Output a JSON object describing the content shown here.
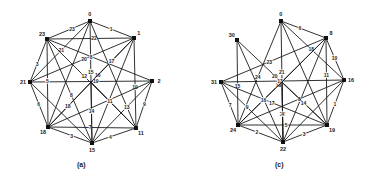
{
  "figure": {
    "background": "#ffffff",
    "ink_color": "#1a1a1a",
    "graphs": [
      {
        "id": "a",
        "caption": "(a)",
        "caption_pos": [
          83,
          167
        ],
        "nodes": [
          {
            "label": "0",
            "x": 90,
            "y": 21
          },
          {
            "label": "1",
            "x": 134,
            "y": 38
          },
          {
            "label": "2",
            "x": 152,
            "y": 81
          },
          {
            "label": "11",
            "x": 136,
            "y": 128
          },
          {
            "label": "15",
            "x": 92,
            "y": 143
          },
          {
            "label": "18",
            "x": 48,
            "y": 127
          },
          {
            "label": "21",
            "x": 30,
            "y": 82
          },
          {
            "label": "23",
            "x": 47,
            "y": 39
          },
          {
            "label": "c",
            "x": 91,
            "y": 82,
            "hidden": true
          }
        ],
        "edges": [
          {
            "from": "0",
            "to": "23",
            "label": "23"
          },
          {
            "from": "0",
            "to": "1",
            "label": "1"
          },
          {
            "from": "23",
            "to": "1",
            "label": "22"
          },
          {
            "from": "0",
            "to": "15",
            "label": "15"
          },
          {
            "from": "0",
            "to": "21",
            "label": "21"
          },
          {
            "from": "0",
            "to": "11",
            "label": ""
          },
          {
            "from": "0",
            "to": "18",
            "label": ""
          },
          {
            "from": "1",
            "to": "21",
            "label": "20"
          },
          {
            "from": "1",
            "to": "11",
            "label": "10"
          },
          {
            "from": "1",
            "to": "18",
            "label": "16"
          },
          {
            "from": "1",
            "to": "15",
            "label": ""
          },
          {
            "from": "21",
            "to": "2",
            "label": "19"
          },
          {
            "from": "21",
            "to": "23",
            "label": "3"
          },
          {
            "from": "21",
            "to": "18",
            "label": "6"
          },
          {
            "from": "21",
            "to": "15",
            "label": ""
          },
          {
            "from": "23",
            "to": "2",
            "label": "8"
          },
          {
            "from": "23",
            "to": "18",
            "label": "5"
          },
          {
            "from": "23",
            "to": "15",
            "label": "8"
          },
          {
            "from": "23",
            "to": "11",
            "label": "12"
          },
          {
            "from": "2",
            "to": "11",
            "label": "9"
          },
          {
            "from": "2",
            "to": "18",
            "label": ""
          },
          {
            "from": "2",
            "to": "15",
            "label": "13"
          },
          {
            "from": "18",
            "to": "11",
            "label": "7"
          },
          {
            "from": "18",
            "to": "15",
            "label": "3"
          },
          {
            "from": "15",
            "to": "11",
            "label": "4"
          },
          {
            "from": "c",
            "to": "1",
            "label": "17"
          },
          {
            "from": "c",
            "to": "18",
            "label": "18"
          },
          {
            "from": "c",
            "to": "11",
            "label": "11"
          },
          {
            "from": "c",
            "to": "15",
            "label": "14"
          }
        ]
      },
      {
        "id": "c",
        "caption": "(c)",
        "caption_pos": [
          281,
          167
        ],
        "nodes": [
          {
            "label": "0",
            "x": 281,
            "y": 21
          },
          {
            "label": "8",
            "x": 326,
            "y": 38
          },
          {
            "label": "16",
            "x": 344,
            "y": 80
          },
          {
            "label": "19",
            "x": 327,
            "y": 125
          },
          {
            "label": "22",
            "x": 283,
            "y": 142
          },
          {
            "label": "24",
            "x": 238,
            "y": 125
          },
          {
            "label": "31",
            "x": 221,
            "y": 82
          },
          {
            "label": "30",
            "x": 237,
            "y": 40
          },
          {
            "label": "c",
            "x": 282,
            "y": 82,
            "hidden": true
          }
        ],
        "edges": [
          {
            "from": "0",
            "to": "8",
            "label": "6"
          },
          {
            "from": "0",
            "to": "16",
            "label": "18"
          },
          {
            "from": "0",
            "to": "24",
            "label": "24"
          },
          {
            "from": "0",
            "to": "22",
            "label": "21"
          },
          {
            "from": "0",
            "to": "19",
            "label": ""
          },
          {
            "from": "30",
            "to": "24",
            "label": "15"
          },
          {
            "from": "30",
            "to": "19",
            "label": "20"
          },
          {
            "from": "30",
            "to": "22",
            "label": ""
          },
          {
            "from": "8",
            "to": "31",
            "label": "23"
          },
          {
            "from": "8",
            "to": "19",
            "label": "11"
          },
          {
            "from": "8",
            "to": "16",
            "label": "10"
          },
          {
            "from": "8",
            "to": "24",
            "label": "19"
          },
          {
            "from": "8",
            "to": "22",
            "label": ""
          },
          {
            "from": "31",
            "to": "16",
            "label": "13"
          },
          {
            "from": "31",
            "to": "24",
            "label": "7"
          },
          {
            "from": "31",
            "to": "22",
            "label": "9"
          },
          {
            "from": "31",
            "to": "19",
            "label": "17"
          },
          {
            "from": "16",
            "to": "19",
            "label": "1"
          },
          {
            "from": "16",
            "to": "24",
            "label": "8"
          },
          {
            "from": "16",
            "to": "22",
            "label": ""
          },
          {
            "from": "24",
            "to": "19",
            "label": "5"
          },
          {
            "from": "24",
            "to": "22",
            "label": "2"
          },
          {
            "from": "22",
            "to": "19",
            "label": "3"
          },
          {
            "from": "c",
            "to": "22",
            "label": "22"
          },
          {
            "from": "c",
            "to": "24",
            "label": "16"
          },
          {
            "from": "c",
            "to": "19",
            "label": "14"
          },
          {
            "from": "c",
            "to": "22",
            "label": "4"
          },
          {
            "from": "c",
            "to": "8",
            "label": ""
          }
        ]
      }
    ]
  }
}
